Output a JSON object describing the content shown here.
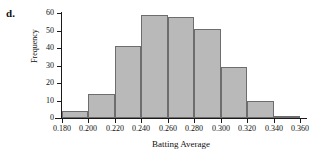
{
  "part_label": "d.",
  "chart_data": {
    "type": "bar",
    "title": "",
    "xlabel": "Batting Average",
    "ylabel": "Frequency",
    "categories": [
      "0.180-0.200",
      "0.200-0.220",
      "0.220-0.240",
      "0.240-0.260",
      "0.260-0.280",
      "0.280-0.300",
      "0.300-0.320",
      "0.320-0.340",
      "0.340-0.360"
    ],
    "bin_edges": [
      0.18,
      0.2,
      0.22,
      0.24,
      0.26,
      0.28,
      0.3,
      0.32,
      0.34,
      0.36
    ],
    "values": [
      4,
      14,
      41,
      59,
      58,
      51,
      29,
      10,
      1
    ],
    "xlim": [
      0.18,
      0.36
    ],
    "ylim": [
      0,
      60
    ],
    "xticks": [
      "0.180",
      "0.200",
      "0.220",
      "0.240",
      "0.260",
      "0.280",
      "0.300",
      "0.320",
      "0.340",
      "0.360"
    ],
    "xtick_values": [
      0.18,
      0.2,
      0.22,
      0.24,
      0.26,
      0.28,
      0.3,
      0.32,
      0.34,
      0.36
    ],
    "yticks": [
      "0",
      "10",
      "20",
      "30",
      "40",
      "50",
      "60"
    ],
    "ytick_values": [
      0,
      10,
      20,
      30,
      40,
      50,
      60
    ],
    "grid": false,
    "legend": "none",
    "bar_fill_color": "#b9b9b9",
    "bar_border_color": "#6d6d6d",
    "axis_color": "#1a1a1a"
  }
}
